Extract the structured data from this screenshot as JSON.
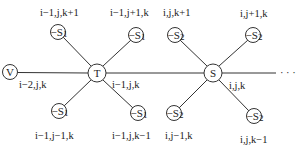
{
  "diagram": {
    "nodes": {
      "V": {
        "label": "V",
        "cx": 10,
        "cy": 72,
        "r": 7.5,
        "coord": "i-2,j,k"
      },
      "T": {
        "label": "T",
        "cx": 97,
        "cy": 73,
        "r": 9,
        "coord": "i-1,j,k"
      },
      "S": {
        "label": "S",
        "cx": 213,
        "cy": 73,
        "r": 9,
        "coord": "i,j,k"
      }
    },
    "neighbor_label_prefix": "−S",
    "t_neighbors": [
      {
        "sub": "1",
        "cx": 58,
        "cy": 32,
        "coord": "i−1,j,k+1"
      },
      {
        "sub": "1",
        "cx": 136,
        "cy": 35,
        "coord": "i−1,j+1,k"
      },
      {
        "sub": "1",
        "cx": 59,
        "cy": 111,
        "coord": "i−1,j−1,k"
      },
      {
        "sub": "1",
        "cx": 138,
        "cy": 113,
        "coord": "i−1,j,k−1"
      }
    ],
    "s_neighbors": [
      {
        "sub": "2",
        "cx": 175,
        "cy": 35,
        "coord": "i,j,k+1"
      },
      {
        "sub": "2",
        "cx": 253,
        "cy": 35,
        "coord": "i,j+1,k"
      },
      {
        "sub": "2",
        "cx": 174,
        "cy": 113,
        "coord": "i,j−1,k"
      },
      {
        "sub": "2",
        "cx": 254,
        "cy": 116,
        "coord": "i,j,k−1"
      }
    ],
    "center_labels": {
      "V": "i−2,j,k",
      "T": "i−1,j,k",
      "S": "i,j,k"
    },
    "continuation": "· · ·",
    "line_color": "#333333"
  }
}
